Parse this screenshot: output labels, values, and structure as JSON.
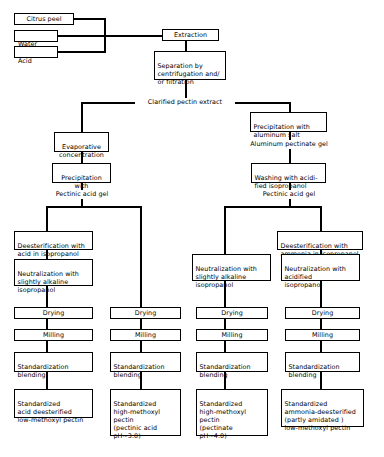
{
  "diagram": {
    "stroke_color": "#000000",
    "background_color": "#ffffff"
  },
  "inputs": [
    {
      "id": "citrus-peel",
      "label": "Citrus peel"
    },
    {
      "id": "water",
      "label": "Water"
    },
    {
      "id": "acid",
      "label": "Acid"
    }
  ],
  "common_stage": {
    "extraction": "Extraction",
    "separation": "Separation by\ncentrifugation and/\nor filtration",
    "clarified_extract": "Clarified pectin extract"
  },
  "left_branch": {
    "evaporative_concentration": "Evaporative\nconcentration",
    "precipitation_isopropanol": "Precipitation\nwith isopropanol",
    "pectinic_acid_gel": "Pectinic acid gel"
  },
  "right_branch": {
    "precipitation_aluminum": "Precipitation with\naluminum salt",
    "aluminum_pectinate_gel": "Aluminum pectinate gel",
    "washing_acidified": "Washing with acidi-\nfied isopropanol",
    "pectinic_acid_gel": "Pectinic acid gel"
  },
  "columns": [
    {
      "id": "column-1-acid-deesterified",
      "deesterification": "Deesterification with\nacid in isopropanol",
      "neutralization": "Neutralization with\nslightly alkaline\nisopropanol",
      "drying": "Drying",
      "milling": "Milling",
      "standardization": "Standardization\nblending",
      "product": "Standardized\nacid deesterified\nlow-methoxyl pectin"
    },
    {
      "id": "column-2-high-methoxyl-pectinic-acid",
      "deesterification": null,
      "neutralization": null,
      "drying": "Drying",
      "milling": "Milling",
      "standardization": "Standardization\nblending",
      "product": "Standardized\nhigh-methoxyl\npectin\n(pectinic acid\n   pH~3.0)"
    },
    {
      "id": "column-3-high-methoxyl-pectinate",
      "deesterification": null,
      "neutralization": "Neutralization with\nslightly alkaline\nisopropanol",
      "drying": "Drying",
      "milling": "Milling",
      "standardization": "Standardization\nblending",
      "product": "Standardized\nhigh-methoxyl\npectin\n(pectinate\n   pH~4.0)"
    },
    {
      "id": "column-4-ammonia-deesterified",
      "deesterification": "Deesterification with\nammonia in isopropanol",
      "neutralization": "Neutralization with\nacidified\nisopropanol",
      "drying": "Drying",
      "milling": "Milling",
      "standardization": "Standardization\nblending",
      "product": "Standardized\nammonia-deesterified\n(partly amidated )\nlow-methoxyl pectin"
    }
  ]
}
